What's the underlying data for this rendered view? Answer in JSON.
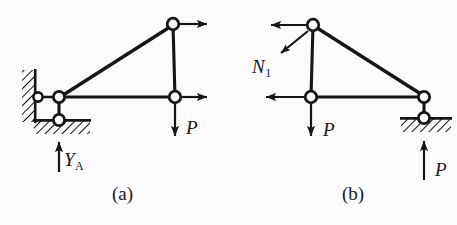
{
  "figure": {
    "type": "free-body-diagram",
    "background_color": "#fbfbfb",
    "ink_color": "#16161a",
    "captions": [
      {
        "id": "a",
        "text": "(a)",
        "x": 112,
        "y": 193
      },
      {
        "id": "b",
        "text": "(b)",
        "x": 342,
        "y": 193
      }
    ],
    "panels": [
      {
        "id": "a",
        "caption": "(a)",
        "nodes": [
          {
            "name": "wall-pin",
            "x": 38,
            "y": 97,
            "r": 5
          },
          {
            "name": "left-joint",
            "x": 59,
            "y": 97,
            "r": 6
          },
          {
            "name": "base-pin",
            "x": 59,
            "y": 120,
            "r": 6
          },
          {
            "name": "top-joint",
            "x": 173,
            "y": 24,
            "r": 6
          },
          {
            "name": "right-joint",
            "x": 175,
            "y": 97,
            "r": 6
          }
        ],
        "members": [
          {
            "name": "bottom-chord",
            "from": "left-joint",
            "to": "right-joint"
          },
          {
            "name": "diagonal-chord",
            "from": "left-joint",
            "to": "top-joint"
          },
          {
            "name": "vertical-post",
            "from": "top-joint",
            "to": "right-joint"
          },
          {
            "name": "support-link",
            "from": "left-joint",
            "to": "base-pin"
          },
          {
            "name": "wall-link",
            "from": "wall-pin",
            "to": "left-joint"
          }
        ],
        "supports": [
          {
            "name": "vertical-wall-support",
            "kind": "hatched-wall",
            "orientation": "vertical",
            "x": 22,
            "y": 70,
            "w": 13,
            "h": 52
          },
          {
            "name": "ground-support",
            "kind": "hatched-ground",
            "orientation": "horizontal",
            "x": 34,
            "y": 120,
            "w": 56,
            "h": 13
          }
        ],
        "forces": [
          {
            "name": "force-top-right",
            "label": "",
            "direction": "right",
            "from_x": 179,
            "from_y": 24,
            "to_x": 215,
            "to_y": 24
          },
          {
            "name": "force-mid-right",
            "label": "",
            "direction": "right",
            "from_x": 181,
            "from_y": 97,
            "to_x": 215,
            "to_y": 97
          },
          {
            "name": "force-p-down",
            "label": "P",
            "direction": "down",
            "from_x": 175,
            "from_y": 103,
            "to_x": 175,
            "to_y": 143
          },
          {
            "name": "reaction-ya-up",
            "label": "Y",
            "sublabel": "A",
            "direction": "up",
            "from_x": 59,
            "from_y": 172,
            "to_x": 59,
            "to_y": 136
          }
        ],
        "labels": [
          {
            "name": "label-p-a",
            "text": "P",
            "sub": "",
            "x": 187,
            "y": 128
          },
          {
            "name": "label-ya",
            "text": "Y",
            "sub": "A",
            "x": 64,
            "y": 160
          }
        ]
      },
      {
        "id": "b",
        "caption": "(b)",
        "nodes": [
          {
            "name": "top-joint",
            "x": 313,
            "y": 25,
            "r": 6
          },
          {
            "name": "mid-joint",
            "x": 311,
            "y": 97,
            "r": 6
          },
          {
            "name": "right-joint",
            "x": 424,
            "y": 97,
            "r": 6
          },
          {
            "name": "base-pin",
            "x": 424,
            "y": 118,
            "r": 6
          }
        ],
        "members": [
          {
            "name": "vertical-post",
            "from": "top-joint",
            "to": "mid-joint"
          },
          {
            "name": "bottom-chord",
            "from": "mid-joint",
            "to": "right-joint"
          },
          {
            "name": "diagonal-chord",
            "from": "top-joint",
            "to": "right-joint"
          },
          {
            "name": "support-link",
            "from": "right-joint",
            "to": "base-pin"
          }
        ],
        "supports": [
          {
            "name": "ground-support",
            "kind": "hatched-ground",
            "orientation": "horizontal",
            "x": 401,
            "y": 118,
            "w": 50,
            "h": 13
          }
        ],
        "forces": [
          {
            "name": "force-top-left",
            "label": "",
            "direction": "left",
            "from_x": 307,
            "from_y": 25,
            "to_x": 263,
            "to_y": 25
          },
          {
            "name": "force-n1",
            "label": "N",
            "sublabel": "1",
            "direction": "down-left",
            "from_x": 307,
            "from_y": 30,
            "to_x": 275,
            "to_y": 57
          },
          {
            "name": "force-mid-left",
            "label": "",
            "direction": "left",
            "from_x": 305,
            "from_y": 97,
            "to_x": 258,
            "to_y": 97
          },
          {
            "name": "force-p-down",
            "label": "P",
            "direction": "down",
            "from_x": 311,
            "from_y": 103,
            "to_x": 311,
            "to_y": 143
          },
          {
            "name": "reaction-p-up",
            "label": "P",
            "direction": "up",
            "from_x": 424,
            "from_y": 180,
            "to_x": 424,
            "to_y": 136
          }
        ],
        "labels": [
          {
            "name": "label-n1",
            "text": "N",
            "sub": "1",
            "x": 253,
            "y": 68
          },
          {
            "name": "label-p-b-mid",
            "text": "P",
            "sub": "",
            "x": 324,
            "y": 130
          },
          {
            "name": "label-p-b-bottom",
            "text": "P",
            "sub": "",
            "x": 436,
            "y": 170
          }
        ]
      }
    ]
  }
}
